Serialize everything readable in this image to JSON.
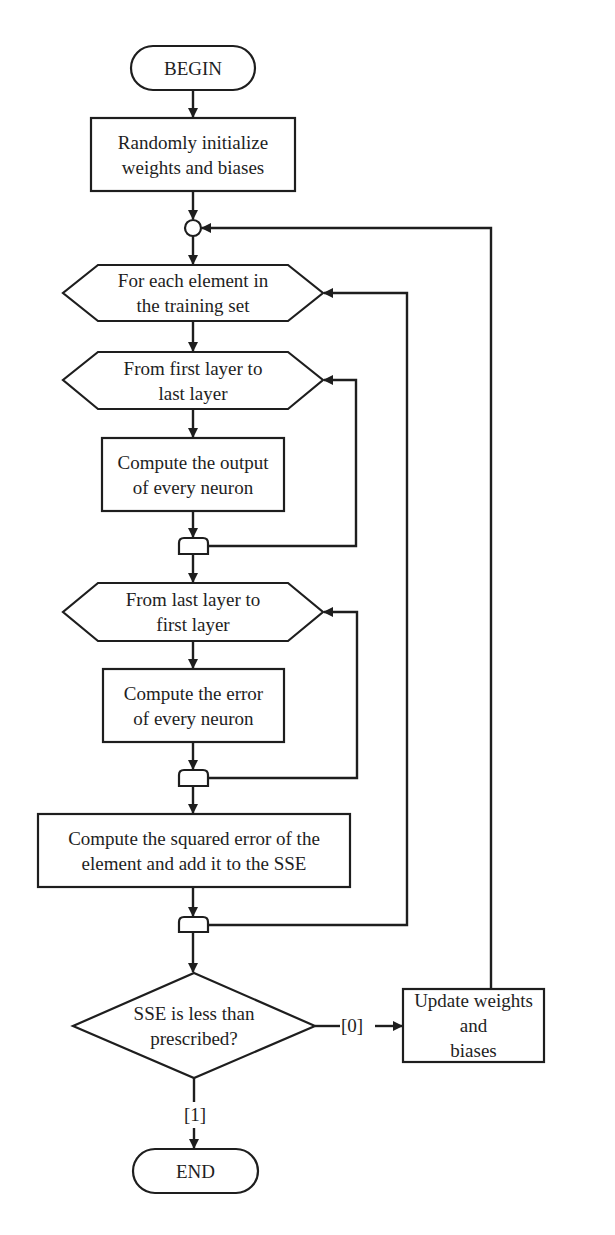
{
  "diagram": {
    "type": "flowchart",
    "colors": {
      "stroke": "#1e1e1e",
      "background": "#ffffff",
      "text": "#1e1e1e"
    },
    "nodes": {
      "begin": {
        "shape": "terminator",
        "label": "BEGIN"
      },
      "init": {
        "shape": "process",
        "label": "Randomly initialize\nweights and biases"
      },
      "connector": {
        "shape": "connector-circle",
        "label": ""
      },
      "loop_elements": {
        "shape": "loop-limit-hexagon",
        "label": "For each element in\nthe training set"
      },
      "loop_forward": {
        "shape": "loop-limit-hexagon",
        "label": "From first layer to\nlast layer"
      },
      "compute_output": {
        "shape": "process",
        "label": "Compute the output\nof every neuron"
      },
      "end_forward": {
        "shape": "loop-end",
        "label": ""
      },
      "loop_backward": {
        "shape": "loop-limit-hexagon",
        "label": "From last layer to\nfirst layer"
      },
      "compute_error": {
        "shape": "process",
        "label": "Compute the error\nof every neuron"
      },
      "end_backward": {
        "shape": "loop-end",
        "label": ""
      },
      "compute_sse": {
        "shape": "process",
        "label": "Compute the squared error of the\nelement and add it to the SSE"
      },
      "end_elements": {
        "shape": "loop-end",
        "label": ""
      },
      "decision": {
        "shape": "decision",
        "label": "SSE is less than\nprescribed?"
      },
      "update": {
        "shape": "process",
        "label": "Update weights and\nbiases"
      },
      "end": {
        "shape": "terminator",
        "label": "END"
      }
    },
    "edges": [
      {
        "from": "begin",
        "to": "init",
        "label": ""
      },
      {
        "from": "init",
        "to": "connector",
        "label": ""
      },
      {
        "from": "connector",
        "to": "loop_elements",
        "label": ""
      },
      {
        "from": "loop_elements",
        "to": "loop_forward",
        "label": ""
      },
      {
        "from": "loop_forward",
        "to": "compute_output",
        "label": ""
      },
      {
        "from": "compute_output",
        "to": "end_forward",
        "label": ""
      },
      {
        "from": "end_forward",
        "to": "loop_forward",
        "label": ""
      },
      {
        "from": "end_forward",
        "to": "loop_backward",
        "label": ""
      },
      {
        "from": "loop_backward",
        "to": "compute_error",
        "label": ""
      },
      {
        "from": "compute_error",
        "to": "end_backward",
        "label": ""
      },
      {
        "from": "end_backward",
        "to": "loop_backward",
        "label": ""
      },
      {
        "from": "end_backward",
        "to": "compute_sse",
        "label": ""
      },
      {
        "from": "compute_sse",
        "to": "end_elements",
        "label": ""
      },
      {
        "from": "end_elements",
        "to": "loop_elements",
        "label": ""
      },
      {
        "from": "end_elements",
        "to": "decision",
        "label": ""
      },
      {
        "from": "decision",
        "to": "update",
        "label": "[0]"
      },
      {
        "from": "update",
        "to": "connector",
        "label": ""
      },
      {
        "from": "decision",
        "to": "end",
        "label": "[1]"
      }
    ],
    "edge_labels": {
      "no": "[0]",
      "yes": "[1]"
    }
  }
}
